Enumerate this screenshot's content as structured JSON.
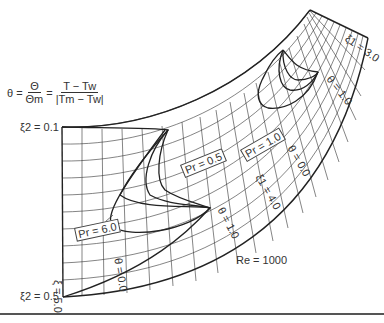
{
  "figure": {
    "formula": {
      "lhs": "θ",
      "eq": "=",
      "frac1_num": "Θ",
      "frac1_den": "Θm",
      "frac2_num": "T − Tw",
      "frac2_den": "|Tm − Tw|"
    },
    "labels": {
      "xi2_top": "ξ2 = 0.1",
      "xi2_bottom": "ξ2 = 0.5",
      "xi1_bottom": "ξ = 5.0",
      "xi1_top": "ξ1 = 3.0",
      "xi1_mid": "ξ1 = 4.0",
      "theta_bl": "θ = 0.0",
      "theta_bm": "θ = 1.0",
      "theta_mid": "θ = 0.0",
      "theta_tr": "θ = 1.0",
      "pr_60": "Pr = 6.0",
      "pr_05": "Pr = 0.5",
      "pr_10": "Pr = 1.0",
      "re": "Re = 1000"
    },
    "colors": {
      "line": "#222222",
      "grid": "#333333",
      "background": "#ffffff"
    }
  }
}
